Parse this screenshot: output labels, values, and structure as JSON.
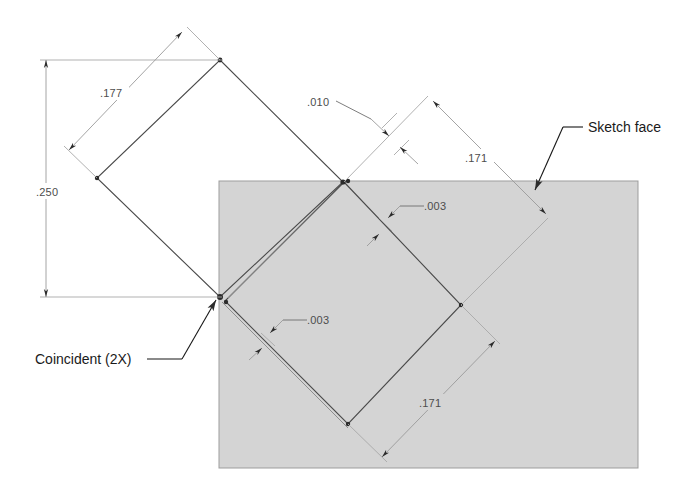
{
  "drawing": {
    "title": "Sketch geometry with coincident diamond profiles",
    "background_color": "#ffffff",
    "face_color": "#d4d4d4",
    "line_color": "#4a4a4a",
    "dim_color": "#9a9a9a",
    "text_color": "#4d4d4d",
    "note_color": "#1a1a1a"
  },
  "dimensions": [
    {
      "id": "dim-250",
      "value": ".250",
      "kind": "vertical-linear",
      "x": 46,
      "y": 192
    },
    {
      "id": "dim-177",
      "value": ".177",
      "kind": "aligned-linear",
      "x": 110,
      "y": 97
    },
    {
      "id": "dim-010",
      "value": ".010",
      "kind": "aligned-gap",
      "x": 312,
      "y": 106
    },
    {
      "id": "dim-171a",
      "value": ".171",
      "kind": "aligned-linear",
      "x": 467,
      "y": 161
    },
    {
      "id": "dim-003a",
      "value": ".003",
      "kind": "aligned-gap",
      "x": 427,
      "y": 210
    },
    {
      "id": "dim-003b",
      "value": ".003",
      "kind": "aligned-gap",
      "x": 310,
      "y": 324
    },
    {
      "id": "dim-171b",
      "value": ".171",
      "kind": "aligned-linear",
      "x": 422,
      "y": 406
    }
  ],
  "annotations": [
    {
      "id": "note-sketch-face",
      "label": "Sketch face",
      "x": 588,
      "y": 132,
      "anchor": "start"
    },
    {
      "id": "note-coincident",
      "label": "Coincident (2X)",
      "x": 35,
      "y": 364,
      "anchor": "start"
    }
  ],
  "face": {
    "name": "sketch-face-rectangle",
    "x": 219,
    "y": 181,
    "width": 419,
    "height": 287
  },
  "profiles": [
    {
      "id": "outer-diamond-left",
      "points": "220,60 343,182 220,297 97,178"
    },
    {
      "id": "outer-diamond-right",
      "points": "344,182 461,305 348,424 225,301"
    }
  ]
}
